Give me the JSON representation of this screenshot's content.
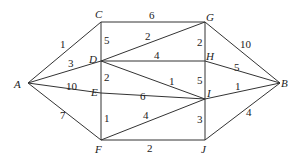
{
  "nodes": [
    {
      "id": "A",
      "x": 28,
      "y": 83,
      "lx": 14,
      "ly": 88
    },
    {
      "id": "C",
      "x": 101,
      "y": 22,
      "lx": 95,
      "ly": 18
    },
    {
      "id": "D",
      "x": 101,
      "y": 61,
      "lx": 89,
      "ly": 63
    },
    {
      "id": "E",
      "x": 101,
      "y": 93,
      "lx": 91,
      "ly": 96
    },
    {
      "id": "F",
      "x": 101,
      "y": 140,
      "lx": 95,
      "ly": 153
    },
    {
      "id": "G",
      "x": 205,
      "y": 22,
      "lx": 206,
      "ly": 21
    },
    {
      "id": "H",
      "x": 205,
      "y": 61,
      "lx": 206,
      "ly": 60
    },
    {
      "id": "I",
      "x": 205,
      "y": 99,
      "lx": 207,
      "ly": 97
    },
    {
      "id": "J",
      "x": 205,
      "y": 140,
      "lx": 201,
      "ly": 153
    },
    {
      "id": "B",
      "x": 280,
      "y": 83,
      "lx": 281,
      "ly": 87
    }
  ],
  "edges": [
    {
      "from": "A",
      "to": "C",
      "w": "1",
      "wx": 60,
      "wy": 48
    },
    {
      "from": "A",
      "to": "D",
      "w": "3",
      "wx": 68,
      "wy": 67
    },
    {
      "from": "A",
      "to": "E",
      "w": "10",
      "wx": 66,
      "wy": 90
    },
    {
      "from": "A",
      "to": "F",
      "w": "7",
      "wx": 60,
      "wy": 119
    },
    {
      "from": "C",
      "to": "G",
      "w": "6",
      "wx": 149,
      "wy": 19
    },
    {
      "from": "C",
      "to": "D",
      "w": "5",
      "wx": 104,
      "wy": 44
    },
    {
      "from": "D",
      "to": "G",
      "w": "2",
      "wx": 145,
      "wy": 40
    },
    {
      "from": "D",
      "to": "H",
      "w": "4",
      "wx": 154,
      "wy": 59
    },
    {
      "from": "D",
      "to": "I",
      "w": "1",
      "wx": 169,
      "wy": 85
    },
    {
      "from": "D",
      "to": "E",
      "w": "2",
      "wx": 104,
      "wy": 81
    },
    {
      "from": "E",
      "to": "I",
      "w": "6",
      "wx": 140,
      "wy": 100
    },
    {
      "from": "E",
      "to": "F",
      "w": "1",
      "wx": 104,
      "wy": 122
    },
    {
      "from": "F",
      "to": "I",
      "w": "4",
      "wx": 143,
      "wy": 119
    },
    {
      "from": "F",
      "to": "J",
      "w": "2",
      "wx": 147,
      "wy": 152
    },
    {
      "from": "G",
      "to": "H",
      "w": "2",
      "wx": 197,
      "wy": 46
    },
    {
      "from": "G",
      "to": "B",
      "w": "10",
      "wx": 240,
      "wy": 48
    },
    {
      "from": "H",
      "to": "I",
      "w": "5",
      "wx": 197,
      "wy": 84
    },
    {
      "from": "H",
      "to": "B",
      "w": "5",
      "wx": 234,
      "wy": 71
    },
    {
      "from": "I",
      "to": "B",
      "w": "1",
      "wx": 235,
      "wy": 90
    },
    {
      "from": "I",
      "to": "J",
      "w": "3",
      "wx": 197,
      "wy": 123
    },
    {
      "from": "J",
      "to": "B",
      "w": "4",
      "wx": 246,
      "wy": 116
    }
  ]
}
